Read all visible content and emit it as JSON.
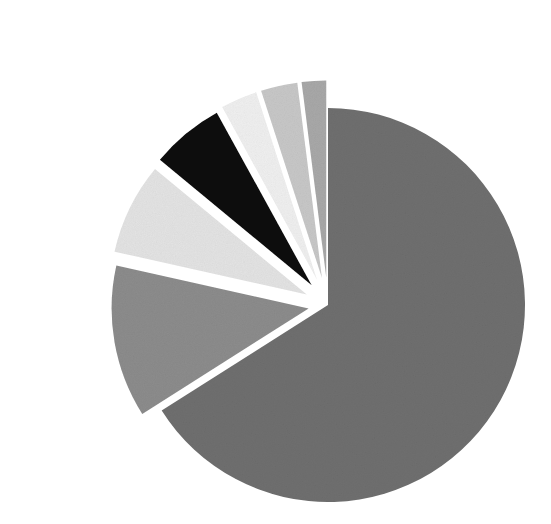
{
  "figure": {
    "name": "grayscale-exploded-pie-chart",
    "width": 551,
    "height": 524,
    "background": "#ffffff",
    "title": "",
    "has_legend": false,
    "has_labels": false,
    "has_axes": false
  },
  "geometry": {
    "center_x": 328,
    "center_y": 305,
    "radius": 197,
    "start_angle_deg": -90,
    "direction": "clockwise"
  },
  "chart_data": {
    "type": "pie",
    "title": "",
    "xlabel": "",
    "ylabel": "",
    "legend_position": "none",
    "grid": false,
    "labels": [
      "Slice 1",
      "Slice 2",
      "Slice 3",
      "Slice 4",
      "Slice 5",
      "Slice 6",
      "Slice 7"
    ],
    "values": [
      66.0,
      12.5,
      7.5,
      6.0,
      3.0,
      3.0,
      2.0
    ],
    "percentages": [
      66.0,
      12.5,
      7.5,
      6.0,
      3.0,
      3.0,
      2.0
    ],
    "colors": [
      "#6f6f6f",
      "#8c8c8c",
      "#e3e3e3",
      "#080808",
      "#efefef",
      "#c7c7c7",
      "#a8a8a8"
    ],
    "explode": [
      0.0,
      0.1,
      0.12,
      0.13,
      0.14,
      0.14,
      0.14
    ],
    "slices": [
      {
        "label": "Slice 1",
        "value": 66.0,
        "percent": 66.0,
        "color": "#6f6f6f",
        "start_angle": -90,
        "end_angle": 147.6,
        "explode": 0.0,
        "color_name": "dark-gray"
      },
      {
        "label": "Slice 2",
        "value": 12.5,
        "percent": 12.5,
        "color": "#8c8c8c",
        "start_angle": 147.6,
        "end_angle": 192.6,
        "explode": 0.1,
        "color_name": "medium-gray"
      },
      {
        "label": "Slice 3",
        "value": 7.5,
        "percent": 7.5,
        "color": "#e3e3e3",
        "start_angle": 192.6,
        "end_angle": 219.6,
        "explode": 0.12,
        "color_name": "very-light-gray"
      },
      {
        "label": "Slice 4",
        "value": 6.0,
        "percent": 6.0,
        "color": "#080808",
        "start_angle": 219.6,
        "end_angle": 241.2,
        "explode": 0.13,
        "color_name": "black"
      },
      {
        "label": "Slice 5",
        "value": 3.0,
        "percent": 3.0,
        "color": "#efefef",
        "start_angle": 241.2,
        "end_angle": 252.0,
        "explode": 0.14,
        "color_name": "pale-gray"
      },
      {
        "label": "Slice 6",
        "value": 3.0,
        "percent": 3.0,
        "color": "#c7c7c7",
        "start_angle": 252.0,
        "end_angle": 262.8,
        "explode": 0.14,
        "color_name": "light-gray"
      },
      {
        "label": "Slice 7",
        "value": 2.0,
        "percent": 2.0,
        "color": "#a8a8a8",
        "start_angle": 262.8,
        "end_angle": 270.0,
        "explode": 0.14,
        "color_name": "light-medium-gray"
      }
    ]
  }
}
